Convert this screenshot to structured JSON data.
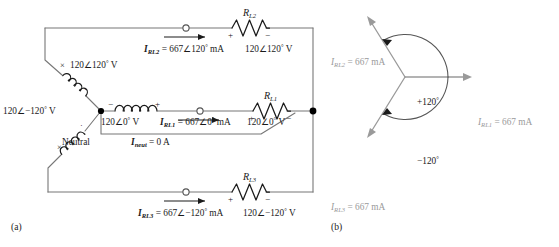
{
  "figure": {
    "panel_a_label": "(a)",
    "panel_b_label": "(b)"
  },
  "circuit": {
    "title": "balanced-wye-wye-three-phase-circuit",
    "sources": [
      {
        "name": "phase-2-source",
        "label": "120∠120° V",
        "polarity_top": "×",
        "polarity_bottom": "·"
      },
      {
        "name": "phase-1-source",
        "label": "120∠0° V",
        "polarity_left": "−",
        "polarity_right": "+"
      },
      {
        "name": "phase-3-source",
        "label": "120∠−120° V",
        "polarity_top": "·",
        "polarity_bottom": "×"
      }
    ],
    "neutral_label": "Neutral",
    "neutral_current": {
      "symbol": "I",
      "symbol_sub": "neut",
      "equals": "=",
      "value": "0 A"
    },
    "branches": [
      {
        "name": "branch-top",
        "resistor_label": "R",
        "resistor_sub": "L2",
        "current": {
          "symbol": "I",
          "symbol_sub": "RL2",
          "equals": "=",
          "value": "667∠120° mA"
        },
        "voltage": "120∠120° V",
        "plus": "+",
        "minus": "−"
      },
      {
        "name": "branch-middle",
        "resistor_label": "R",
        "resistor_sub": "L1",
        "current": {
          "symbol": "I",
          "symbol_sub": "RL1",
          "equals": "=",
          "value": "667∠0° mA"
        },
        "voltage": "120∠0° V",
        "plus": "+",
        "minus": "−"
      },
      {
        "name": "branch-bottom",
        "resistor_label": "R",
        "resistor_sub": "L3",
        "current": {
          "symbol": "I",
          "symbol_sub": "RL3",
          "equals": "=",
          "value": "667∠−120° mA"
        },
        "voltage": "120∠−120° V",
        "plus": "+",
        "minus": "−"
      }
    ]
  },
  "phasor": {
    "title": "phasor-diagram-line-currents",
    "angle_labels": [
      "+120°",
      "−120°"
    ],
    "phasors": [
      {
        "name": "phasor-irl2",
        "symbol": "I",
        "symbol_sub": "RL2",
        "equals": "=",
        "value": "667 mA",
        "angle_deg": 120
      },
      {
        "name": "phasor-irl1",
        "symbol": "I",
        "symbol_sub": "RL1",
        "equals": "=",
        "value": "667 mA",
        "angle_deg": 0
      },
      {
        "name": "phasor-irl3",
        "symbol": "I",
        "symbol_sub": "RL3",
        "equals": "=",
        "value": "667 mA",
        "angle_deg": -120
      }
    ],
    "colors": {
      "phasor_line": "#9a9a9a",
      "arc": "#555555",
      "text": "#9a9a9a"
    }
  },
  "colors": {
    "wire": "#777777",
    "ink": "#1a1a1a",
    "node": "#000000",
    "background": "#ffffff"
  }
}
